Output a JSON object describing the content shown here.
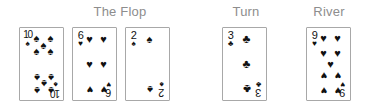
{
  "headings": [
    {
      "label": "The Flop",
      "left": 64,
      "top": 4,
      "width": 112
    },
    {
      "label": "Turn",
      "left": 218,
      "top": 4,
      "width": 56
    },
    {
      "label": "River",
      "left": 298,
      "top": 4,
      "width": 62
    }
  ],
  "suit_glyphs": {
    "spades": "♠",
    "hearts": "♥",
    "clubs": "♣",
    "diamonds": "♦"
  },
  "colors": {
    "heading_text": "#8d8d8d",
    "card_face": "#ffffff",
    "card_border": "#a8a8a8",
    "pip_black": "#111111",
    "page_background": "#ffffff"
  },
  "cards": [
    {
      "name": "card-ten-of-spades",
      "rank": "10",
      "suit": "spades",
      "suit_symbol": "♠",
      "group": "flop",
      "left": 19,
      "top": 27,
      "width": 45,
      "height": 74,
      "narrow_rank": true,
      "pips": [
        {
          "x": 22,
          "y": 11,
          "flip": false
        },
        {
          "x": 78,
          "y": 11,
          "flip": false
        },
        {
          "x": 22,
          "y": 31,
          "flip": false
        },
        {
          "x": 78,
          "y": 31,
          "flip": false
        },
        {
          "x": 50,
          "y": 21,
          "flip": false
        },
        {
          "x": 22,
          "y": 69,
          "flip": true
        },
        {
          "x": 78,
          "y": 69,
          "flip": true
        },
        {
          "x": 22,
          "y": 89,
          "flip": true
        },
        {
          "x": 78,
          "y": 89,
          "flip": true
        },
        {
          "x": 50,
          "y": 79,
          "flip": true
        }
      ]
    },
    {
      "name": "card-six-of-hearts",
      "rank": "6",
      "suit": "hearts",
      "suit_symbol": "♥",
      "group": "flop",
      "left": 72,
      "top": 27,
      "width": 45,
      "height": 74,
      "narrow_rank": false,
      "pips": [
        {
          "x": 22,
          "y": 12,
          "flip": false
        },
        {
          "x": 78,
          "y": 12,
          "flip": false
        },
        {
          "x": 22,
          "y": 50,
          "flip": false
        },
        {
          "x": 78,
          "y": 50,
          "flip": false
        },
        {
          "x": 22,
          "y": 88,
          "flip": true
        },
        {
          "x": 78,
          "y": 88,
          "flip": true
        }
      ]
    },
    {
      "name": "card-two-of-spades",
      "rank": "2",
      "suit": "spades",
      "suit_symbol": "♠",
      "group": "flop",
      "left": 125,
      "top": 27,
      "width": 45,
      "height": 74,
      "narrow_rank": false,
      "pips": [
        {
          "x": 50,
          "y": 12,
          "flip": false
        },
        {
          "x": 50,
          "y": 88,
          "flip": true
        }
      ]
    },
    {
      "name": "card-three-of-clubs",
      "rank": "3",
      "suit": "clubs",
      "suit_symbol": "♣",
      "group": "turn",
      "left": 222,
      "top": 27,
      "width": 45,
      "height": 74,
      "narrow_rank": false,
      "pips": [
        {
          "x": 50,
          "y": 12,
          "flip": false
        },
        {
          "x": 50,
          "y": 50,
          "flip": false
        },
        {
          "x": 50,
          "y": 88,
          "flip": true
        }
      ]
    },
    {
      "name": "card-nine-of-hearts",
      "rank": "9",
      "suit": "hearts",
      "suit_symbol": "♥",
      "group": "river",
      "left": 306,
      "top": 27,
      "width": 45,
      "height": 74,
      "narrow_rank": false,
      "pips": [
        {
          "x": 22,
          "y": 11,
          "flip": false
        },
        {
          "x": 78,
          "y": 11,
          "flip": false
        },
        {
          "x": 22,
          "y": 33,
          "flip": false
        },
        {
          "x": 78,
          "y": 33,
          "flip": false
        },
        {
          "x": 50,
          "y": 50,
          "flip": false
        },
        {
          "x": 22,
          "y": 67,
          "flip": true
        },
        {
          "x": 78,
          "y": 67,
          "flip": true
        },
        {
          "x": 22,
          "y": 89,
          "flip": true
        },
        {
          "x": 78,
          "y": 89,
          "flip": true
        }
      ]
    }
  ]
}
